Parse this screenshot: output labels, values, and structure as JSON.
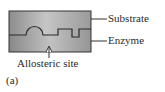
{
  "figure": {
    "panel_label": "(a)",
    "labels": {
      "substrate": "Substrate",
      "enzyme": "Enzyme",
      "allosteric_site": "Allosteric site"
    },
    "colors": {
      "fill_dark": "#8a8a8a",
      "fill_light": "#c4c4c4",
      "outline": "#333333",
      "text": "#2a2a2a",
      "background": "#ffffff"
    }
  }
}
